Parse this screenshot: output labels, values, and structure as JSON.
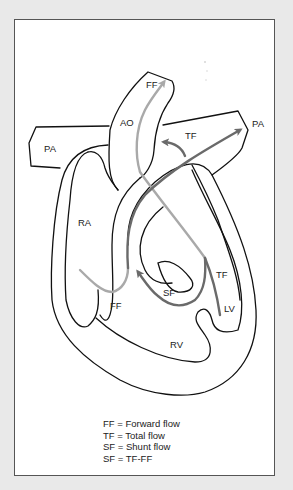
{
  "diagram": {
    "type": "heart-shunt-flow-schematic",
    "colors": {
      "outline": "#111111",
      "forward_flow": "#a9a9a9",
      "total_flow": "#6a6a6a",
      "background": "#e9e9e9",
      "panel": "#ffffff"
    },
    "structures": {
      "pa_left": "PA",
      "pa_right": "PA",
      "ao": "AO",
      "ra": "RA",
      "rv": "RV",
      "lv": "LV"
    },
    "flow_labels": {
      "ff_top": "FF",
      "tf_top": "TF",
      "ff_bottom": "FF",
      "sf": "SF",
      "tf_lv": "TF"
    },
    "legend": [
      {
        "abbr": "FF",
        "eq": "=",
        "meaning": "Forward flow"
      },
      {
        "abbr": "TF",
        "eq": "=",
        "meaning": "Total flow"
      },
      {
        "abbr": "SF",
        "eq": "=",
        "meaning": "Shunt flow"
      },
      {
        "abbr": "SF",
        "eq": "=",
        "meaning": "TF-FF"
      }
    ]
  }
}
